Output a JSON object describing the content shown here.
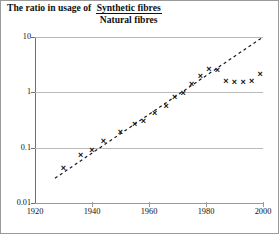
{
  "title": {
    "lead": "The ratio in usage of ",
    "numerator": "Synthetic fibres",
    "denominator": "Natural fibres"
  },
  "chart_data": {
    "type": "scatter",
    "xlabel": "",
    "ylabel": "",
    "yscale": "log",
    "xlim": [
      1920,
      2000
    ],
    "ylim": [
      0.01,
      10
    ],
    "grid": true,
    "legend": null,
    "ytick_labels": [
      "10",
      "1",
      "0.1",
      "0.01"
    ],
    "ytick_values": [
      10,
      1,
      0.1,
      0.01
    ],
    "xtick_labels": [
      "1920",
      "1940",
      "1960",
      "1980",
      "2000"
    ],
    "xtick_values": [
      1920,
      1940,
      1960,
      1980,
      2000
    ],
    "series": [
      {
        "name": "Synthetic / Natural fibre ratio",
        "marker": "x",
        "x": [
          1930,
          1936,
          1940,
          1944,
          1950,
          1955,
          1958,
          1962,
          1966,
          1969,
          1972,
          1975,
          1978,
          1981,
          1984,
          1987,
          1990,
          1993,
          1996,
          1999
        ],
        "y": [
          0.042,
          0.072,
          0.09,
          0.13,
          0.19,
          0.26,
          0.3,
          0.42,
          0.55,
          0.8,
          0.95,
          1.4,
          1.9,
          2.6,
          2.5,
          1.6,
          1.5,
          1.5,
          1.6,
          2.1
        ]
      }
    ],
    "annotations": [
      {
        "type": "trendline",
        "style": "dashed",
        "x": [
          1927,
          2000
        ],
        "y": [
          0.028,
          10.0
        ]
      }
    ]
  }
}
